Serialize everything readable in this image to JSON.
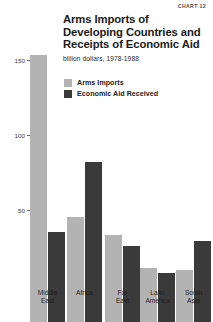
{
  "chart_number": "CHART 12",
  "title_lines": [
    "Arms Imports of",
    "Developing Countries and",
    "Receipts of Economic Aid"
  ],
  "subtitle": "billion dollars, 1978-1988",
  "legend": {
    "items": [
      {
        "label": "Arms Imports",
        "color": "#b3b3b3"
      },
      {
        "label": "Economic Aid Received",
        "color": "#3a3a3a"
      }
    ]
  },
  "axis": {
    "ticks": [
      "150",
      "100",
      "50"
    ]
  },
  "chart_data": {
    "type": "bar",
    "title": "Arms Imports of Developing Countries and Receipts of Economic Aid",
    "subtitle": "billion dollars, 1978-1988",
    "xlabel": "",
    "ylabel": "billion dollars",
    "ylim": [
      0,
      190
    ],
    "yticks": [
      50,
      100,
      150
    ],
    "grid": false,
    "legend_position": "top-right",
    "categories": [
      "Middle\nEast",
      "Africa",
      "Far\nEast",
      "Latin\nAmerica",
      "South\nAsia"
    ],
    "category_labels_flat": [
      "Middle East",
      "Africa",
      "Far East",
      "Latin America",
      "South Asia"
    ],
    "series": [
      {
        "name": "Arms Imports",
        "color": "#b3b3b3",
        "values": [
          178,
          70,
          58,
          36,
          35
        ]
      },
      {
        "name": "Economic Aid Received",
        "color": "#3a3a3a",
        "values": [
          60,
          107,
          51,
          33,
          54
        ]
      }
    ]
  }
}
